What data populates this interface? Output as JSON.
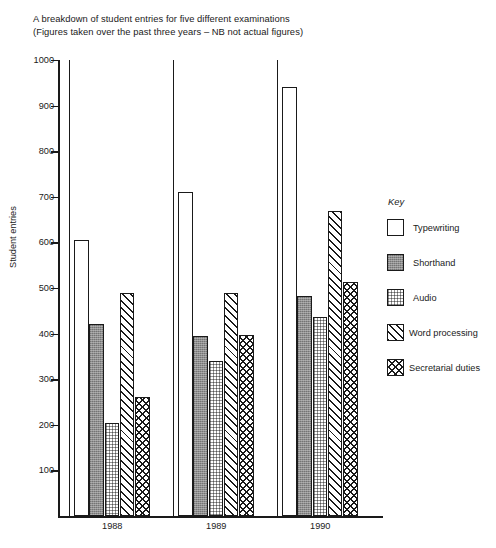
{
  "chart_data": {
    "type": "bar",
    "title": "A breakdown of student entries for five different examinations",
    "subtitle": "(Figures taken over the past three years – NB not actual figures)",
    "xlabel": "",
    "ylabel": "Student entries",
    "ylim": [
      0,
      1000
    ],
    "yticks": [
      100,
      200,
      300,
      400,
      500,
      600,
      700,
      800,
      900,
      1000
    ],
    "grid": false,
    "legend_title": "Key",
    "legend_position": "right",
    "categories": [
      "1988",
      "1989",
      "1990"
    ],
    "series": [
      {
        "name": "Typewriting",
        "pattern": "white",
        "values": [
          605,
          710,
          940
        ]
      },
      {
        "name": "Shorthand",
        "pattern": "solid-grey",
        "values": [
          422,
          395,
          483
        ]
      },
      {
        "name": "Audio",
        "pattern": "dots",
        "values": [
          205,
          340,
          437
        ]
      },
      {
        "name": "Word processing",
        "pattern": "diagonal",
        "values": [
          488,
          490,
          668
        ]
      },
      {
        "name": "Secretarial duties",
        "pattern": "crosshatch",
        "values": [
          261,
          397,
          513
        ]
      }
    ]
  },
  "title": {
    "line1": "A breakdown of student entries for five different examinations",
    "line2": "(Figures taken over the past three years – NB not actual figures)"
  },
  "axes": {
    "y_title": "Student entries",
    "y_ticks": [
      "1000",
      "900",
      "800",
      "700",
      "600",
      "500",
      "400",
      "300",
      "200",
      "100"
    ],
    "x_labels": [
      "1988",
      "1989",
      "1990"
    ]
  },
  "legend": {
    "title": "Key",
    "items": [
      {
        "label": "Typewriting"
      },
      {
        "label": "Shorthand"
      },
      {
        "label": "Audio"
      },
      {
        "label": "Word processing"
      },
      {
        "label": "Secretarial duties"
      }
    ]
  }
}
